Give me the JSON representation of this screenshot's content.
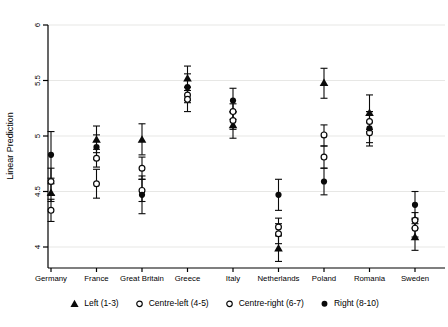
{
  "figure": {
    "background": "#ffffff",
    "axis_color": "#000000",
    "grid_color": "#e7e7e5",
    "marker_color": "#0a0a0a"
  },
  "chart_data": {
    "type": "scatter",
    "title": "",
    "xlabel": "",
    "ylabel": "Linear Prediction",
    "ylim": [
      3.85,
      6.05
    ],
    "yticks": [
      4,
      4.5,
      5,
      5.5,
      6
    ],
    "grid": true,
    "legend_position": "bottom",
    "error_bars": true,
    "categories": [
      "Germany",
      "France",
      "Great Britain",
      "Greece",
      "Italy",
      "Netherlands",
      "Poland",
      "Romania",
      "Sweden"
    ],
    "series": [
      {
        "name": "Left (1-3)",
        "marker": "triangle-filled",
        "values": [
          4.49,
          4.97,
          4.97,
          5.52,
          5.1,
          3.99,
          5.48,
          5.21,
          4.09
        ],
        "ci_low": [
          4.41,
          4.85,
          4.83,
          5.41,
          4.98,
          3.87,
          5.34,
          5.06,
          3.97
        ],
        "ci_high": [
          4.57,
          5.09,
          5.11,
          5.63,
          5.22,
          4.11,
          5.61,
          5.37,
          4.21
        ]
      },
      {
        "name": "Centre-left (4-5)",
        "marker": "circle-hollow",
        "values": [
          4.33,
          4.8,
          4.71,
          5.37,
          5.14,
          4.12,
          5.01,
          5.13,
          4.17
        ],
        "ci_low": [
          4.23,
          4.72,
          4.61,
          5.3,
          5.06,
          4.03,
          4.91,
          5.04,
          4.09
        ],
        "ci_high": [
          4.43,
          4.88,
          4.81,
          5.44,
          5.22,
          4.21,
          5.1,
          5.22,
          4.25
        ]
      },
      {
        "name": "Centre-right (6-7)",
        "marker": "circle-hollow",
        "values": [
          4.59,
          4.57,
          4.51,
          5.33,
          5.22,
          4.18,
          4.81,
          5.03,
          4.24
        ],
        "ci_low": [
          4.47,
          4.44,
          4.41,
          5.22,
          5.15,
          4.1,
          4.71,
          4.94,
          4.17
        ],
        "ci_high": [
          4.71,
          4.7,
          4.61,
          5.44,
          5.29,
          4.26,
          4.91,
          5.12,
          4.31
        ]
      },
      {
        "name": "Right (8-10)",
        "marker": "circle-filled",
        "values": [
          4.83,
          4.9,
          4.47,
          5.44,
          5.32,
          4.47,
          4.59,
          5.07,
          4.38
        ],
        "ci_low": [
          4.62,
          4.79,
          4.3,
          5.32,
          5.21,
          4.33,
          4.47,
          4.91,
          4.26
        ],
        "ci_high": [
          5.04,
          5.01,
          4.64,
          5.56,
          5.43,
          4.61,
          4.71,
          5.22,
          4.5
        ]
      }
    ]
  }
}
